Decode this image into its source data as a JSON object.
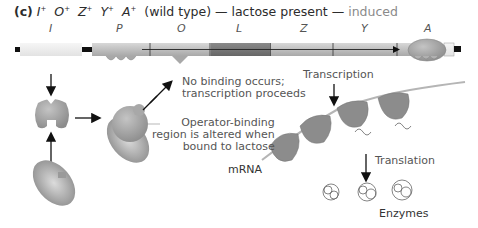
{
  "title": {
    "panel": "(c)",
    "genotype": [
      {
        "gene": "I",
        "sup": "+"
      },
      {
        "gene": "O",
        "sup": "+"
      },
      {
        "gene": "Z",
        "sup": "+"
      },
      {
        "gene": "Y",
        "sup": "+"
      },
      {
        "gene": "A",
        "sup": "+"
      }
    ],
    "descriptor": "(wild type) — lactose present —",
    "state": "induced"
  },
  "genes": [
    {
      "label": "I",
      "x": 51
    },
    {
      "label": "P",
      "x": 118
    },
    {
      "label": "O",
      "x": 179
    },
    {
      "label": "L",
      "x": 237
    },
    {
      "label": "Z",
      "x": 301
    },
    {
      "label": "Y",
      "x": 362
    },
    {
      "label": "A",
      "x": 426
    }
  ],
  "annotations": {
    "no_binding_line1": "No binding occurs;",
    "no_binding_line2": "transcription proceeds",
    "operator_line1": "Operator-binding",
    "operator_line2": "region is altered when",
    "operator_line3": "bound to lactose",
    "transcription": "Transcription",
    "translation": "Translation",
    "mrna": "mRNA",
    "enzymes": "Enzymes"
  },
  "colors": {
    "dna_i_region": "#ececec",
    "dna_body": "#c8c8c8",
    "dna_l_region": "#7a7a7a",
    "protein": "#9a9a9a",
    "ribosome": "#8c8c8c",
    "arrow": "#111111",
    "text": "#555555"
  }
}
